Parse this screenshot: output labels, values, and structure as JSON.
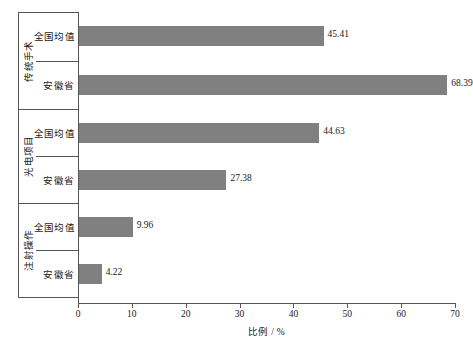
{
  "chart_data": {
    "type": "bar",
    "orientation": "horizontal",
    "title": "",
    "xlabel": "比例 / %",
    "ylabel": "",
    "xlim": [
      0,
      70
    ],
    "xticks": [
      0,
      10,
      20,
      30,
      40,
      50,
      60,
      70
    ],
    "xticklabels": [
      "0",
      "10",
      "20",
      "30",
      "40",
      "50",
      "60",
      "70"
    ],
    "grid": false,
    "legend": false,
    "bar_color": "#808080",
    "axis_color": "#555555",
    "categories": [
      "传统手术",
      "光电项目",
      "注射操作"
    ],
    "subcategories": [
      "全国均值",
      "安徽省"
    ],
    "groups": [
      {
        "label": "传统手术",
        "rows": [
          {
            "label": "全国均值",
            "value": 45.41,
            "value_text": "45.41"
          },
          {
            "label": "安徽省",
            "value": 68.39,
            "value_text": "68.39"
          }
        ]
      },
      {
        "label": "光电项目",
        "rows": [
          {
            "label": "全国均值",
            "value": 44.63,
            "value_text": "44.63"
          },
          {
            "label": "安徽省",
            "value": 27.38,
            "value_text": "27.38"
          }
        ]
      },
      {
        "label": "注射操作",
        "rows": [
          {
            "label": "全国均值",
            "value": 9.96,
            "value_text": "9.96"
          },
          {
            "label": "安徽省",
            "value": 4.22,
            "value_text": "4.22"
          }
        ]
      }
    ],
    "series": [
      {
        "name": "全国均值",
        "values": [
          45.41,
          44.63,
          9.96
        ]
      },
      {
        "name": "安徽省",
        "values": [
          68.39,
          27.38,
          4.22
        ]
      }
    ]
  }
}
